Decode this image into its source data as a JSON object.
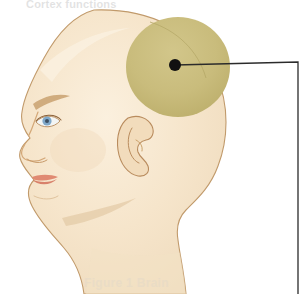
{
  "figure": {
    "title_top": "Cortex functions",
    "watermark_bottom": "Figure 1 Brain",
    "view": "lateral left profile"
  },
  "callout": {
    "marker_label": "callout marker dot",
    "leader_description": "leader line from marker to right margin then downward",
    "marker_x": 175,
    "marker_y": 65,
    "elbow_x": 298,
    "elbow_y": 62,
    "line_end_y": 294
  },
  "regions": [
    {
      "name": "highlighted-cortical-region",
      "shape": "circle",
      "cx": 178,
      "cy": 67,
      "rx": 52,
      "ry": 50,
      "color": "#C9BC7C"
    }
  ],
  "anatomy_parts": [
    {
      "name": "scalp-cranium",
      "label": "Cranium"
    },
    {
      "name": "face-profile",
      "label": "Face"
    },
    {
      "name": "ear",
      "label": "Ear"
    },
    {
      "name": "eye",
      "label": "Eye"
    },
    {
      "name": "eyebrow",
      "label": "Eyebrow"
    },
    {
      "name": "nose",
      "label": "Nose"
    },
    {
      "name": "lips",
      "label": "Lips"
    },
    {
      "name": "jaw",
      "label": "Jaw"
    },
    {
      "name": "neck",
      "label": "Neck"
    }
  ],
  "colors": {
    "background": "#ffffff",
    "skin_fill": "#F5E3C8",
    "skin_fill_light": "#FAEEDB",
    "skin_shadow": "#E8D2B0",
    "outline": "#C19A6B",
    "outline_dark": "#A9793F",
    "highlight_olive": "#C9BC7C",
    "highlight_olive_dark": "#BCAE6B",
    "lips": "#E08A72",
    "lips_dark": "#D2705A",
    "eye_iris": "#7FA8C9",
    "eye_pupil": "#3C4F63",
    "eye_white": "#F3F5F4",
    "marker_dot": "#111111",
    "leader_line": "#2B2B2B"
  }
}
